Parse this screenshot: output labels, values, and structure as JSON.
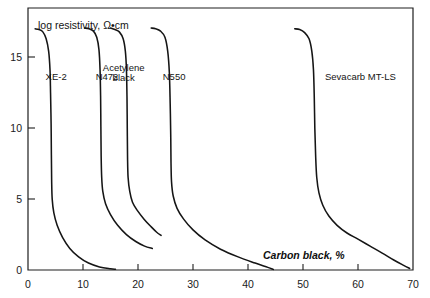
{
  "chart_data": {
    "type": "line",
    "title": "",
    "xlabel": "Carbon black, %",
    "ylabel": "log resistivity, Ω•cm",
    "xlim": [
      0,
      70
    ],
    "ylim": [
      0,
      17
    ],
    "grid": false,
    "legend_position": "inline-labels",
    "xticks": [
      0,
      10,
      20,
      30,
      40,
      50,
      60,
      70
    ],
    "xtick_labels": [
      "0",
      "10",
      "20",
      "30",
      "40",
      "50",
      "60",
      "70"
    ],
    "yticks": [
      0,
      5,
      10,
      15
    ],
    "ytick_labels": [
      "0",
      "5",
      "10",
      "15"
    ],
    "series": [
      {
        "name": "XE-2",
        "label": "XE-2",
        "label_x": 3.2,
        "label_y": 12.3,
        "points": [
          [
            1.3,
            15.65
          ],
          [
            2.0,
            15.6
          ],
          [
            2.7,
            15.45
          ],
          [
            3.3,
            15.0
          ],
          [
            3.75,
            14.2
          ],
          [
            4.0,
            13.0
          ],
          [
            4.1,
            11.5
          ],
          [
            4.2,
            9.5
          ],
          [
            4.25,
            7.5
          ],
          [
            4.3,
            5.8
          ],
          [
            4.4,
            4.6
          ],
          [
            4.7,
            3.7
          ],
          [
            5.3,
            2.9
          ],
          [
            6.3,
            2.1
          ],
          [
            7.6,
            1.4
          ],
          [
            9.2,
            0.85
          ],
          [
            11.0,
            0.45
          ],
          [
            13.0,
            0.2
          ],
          [
            15.0,
            0.08
          ],
          [
            15.9,
            0.05
          ]
        ]
      },
      {
        "name": "N472",
        "label": "N472",
        "label_x": 12.3,
        "label_y": 12.3,
        "points": [
          [
            10.3,
            15.7
          ],
          [
            11.1,
            15.65
          ],
          [
            11.9,
            15.5
          ],
          [
            12.5,
            15.1
          ],
          [
            12.9,
            14.3
          ],
          [
            13.1,
            13.0
          ],
          [
            13.2,
            11.3
          ],
          [
            13.25,
            9.3
          ],
          [
            13.3,
            7.4
          ],
          [
            13.4,
            6.0
          ],
          [
            13.6,
            5.1
          ],
          [
            14.1,
            4.3
          ],
          [
            15.0,
            3.6
          ],
          [
            16.3,
            2.9
          ],
          [
            17.9,
            2.3
          ],
          [
            19.6,
            1.85
          ],
          [
            21.2,
            1.55
          ],
          [
            22.6,
            1.4
          ]
        ]
      },
      {
        "name": "Acetylene black",
        "label": "Acetylene black",
        "label_line1": "Acetylene",
        "label_line2": "black",
        "label_x": 17.4,
        "label_y": 12.6,
        "points": [
          [
            15.0,
            15.7
          ],
          [
            15.8,
            15.6
          ],
          [
            16.6,
            15.45
          ],
          [
            17.3,
            15.0
          ],
          [
            17.7,
            14.2
          ],
          [
            17.9,
            13.0
          ],
          [
            18.0,
            11.2
          ],
          [
            18.05,
            9.2
          ],
          [
            18.1,
            7.3
          ],
          [
            18.2,
            6.0
          ],
          [
            18.5,
            5.1
          ],
          [
            19.0,
            4.4
          ],
          [
            19.9,
            3.85
          ],
          [
            21.1,
            3.3
          ],
          [
            22.4,
            2.8
          ],
          [
            23.4,
            2.45
          ],
          [
            24.2,
            2.25
          ]
        ]
      },
      {
        "name": "N550",
        "label": "N550",
        "label_x": 24.5,
        "label_y": 12.3,
        "points": [
          [
            22.4,
            15.7
          ],
          [
            23.2,
            15.65
          ],
          [
            24.1,
            15.5
          ],
          [
            24.9,
            15.1
          ],
          [
            25.4,
            14.2
          ],
          [
            25.7,
            12.8
          ],
          [
            25.85,
            10.8
          ],
          [
            25.95,
            8.8
          ],
          [
            26.0,
            7.0
          ],
          [
            26.1,
            5.7
          ],
          [
            26.4,
            4.8
          ],
          [
            27.1,
            4.0
          ],
          [
            28.3,
            3.3
          ],
          [
            30.0,
            2.6
          ],
          [
            32.2,
            1.95
          ],
          [
            35.0,
            1.35
          ],
          [
            38.2,
            0.85
          ],
          [
            41.3,
            0.45
          ],
          [
            43.6,
            0.17
          ],
          [
            44.6,
            0.04
          ]
        ]
      },
      {
        "name": "Sevacarb MT-LS",
        "label": "Sevacarb MT-LS",
        "label_x": 54.0,
        "label_y": 12.3,
        "points": [
          [
            48.5,
            15.65
          ],
          [
            49.4,
            15.6
          ],
          [
            50.3,
            15.4
          ],
          [
            51.1,
            15.0
          ],
          [
            51.6,
            14.2
          ],
          [
            51.9,
            13.0
          ],
          [
            52.05,
            11.2
          ],
          [
            52.15,
            9.2
          ],
          [
            52.3,
            7.4
          ],
          [
            52.5,
            6.0
          ],
          [
            52.9,
            5.0
          ],
          [
            53.6,
            4.2
          ],
          [
            54.7,
            3.5
          ],
          [
            56.2,
            2.9
          ],
          [
            58.0,
            2.4
          ],
          [
            60.0,
            2.0
          ],
          [
            62.2,
            1.55
          ],
          [
            64.4,
            1.1
          ],
          [
            66.5,
            0.65
          ],
          [
            68.3,
            0.3
          ],
          [
            69.4,
            0.1
          ]
        ]
      }
    ]
  }
}
